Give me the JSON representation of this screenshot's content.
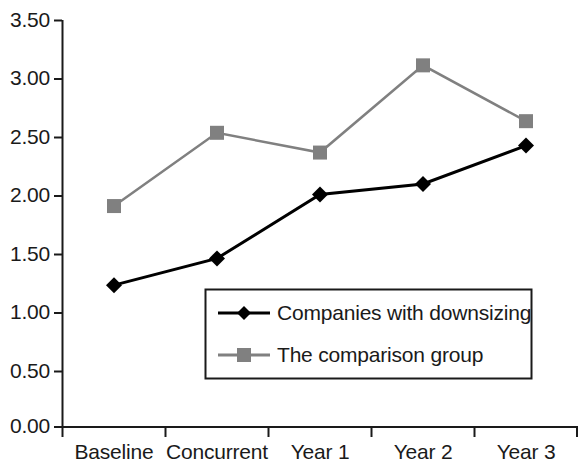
{
  "chart_data": {
    "type": "line",
    "title": "",
    "xlabel": "",
    "ylabel": "",
    "categories": [
      "Baseline",
      "Concurrent",
      "Year 1",
      "Year 2",
      "Year 3"
    ],
    "series": [
      {
        "name": "Companies with downsizing",
        "marker": "diamond",
        "color": "#000000",
        "values": [
          1.22,
          1.45,
          2.0,
          2.09,
          2.42
        ]
      },
      {
        "name": "The comparison group",
        "marker": "square",
        "color": "#808080",
        "values": [
          1.9,
          2.53,
          2.36,
          3.11,
          2.63
        ]
      }
    ],
    "ylim": [
      0.0,
      3.5
    ],
    "ytick_values": [
      0.0,
      0.5,
      1.0,
      1.5,
      2.0,
      2.5,
      3.0,
      3.5
    ],
    "ytick_labels": [
      "0.00",
      "0.50",
      "1.00",
      "1.50",
      "2.00",
      "2.50",
      "3.00",
      "3.50"
    ],
    "grid": false,
    "legend_position": "inside-bottom-center"
  },
  "axes": {
    "y_labels": [
      "3.50",
      "3.00",
      "2.50",
      "2.00",
      "1.50",
      "1.00",
      "0.50",
      "0.00"
    ],
    "x_labels": [
      "Baseline",
      "Concurrent",
      "Year 1",
      "Year 2",
      "Year 3"
    ]
  },
  "legend": {
    "items": [
      {
        "label": "Companies with downsizing",
        "color": "#000000",
        "marker": "diamond"
      },
      {
        "label": "The comparison group",
        "color": "#808080",
        "marker": "square"
      }
    ]
  },
  "colors": {
    "downsizing": "#000000",
    "comparison": "#808080",
    "axis": "#1a1a1a",
    "background": "#ffffff"
  }
}
